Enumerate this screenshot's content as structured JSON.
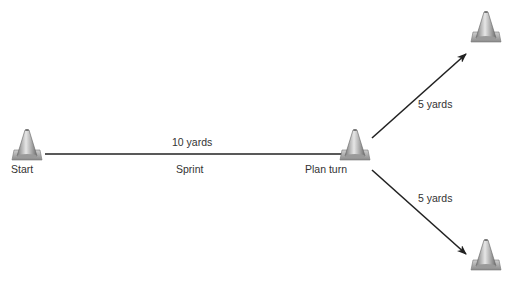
{
  "diagram": {
    "nodes": [
      {
        "id": "start",
        "label": "Start"
      },
      {
        "id": "plan_turn",
        "label": "Plan turn"
      },
      {
        "id": "top_cone",
        "label": ""
      },
      {
        "id": "bottom_cone",
        "label": ""
      }
    ],
    "edges": [
      {
        "from": "start",
        "to": "plan_turn",
        "distance": "10 yards",
        "action": "Sprint"
      },
      {
        "from": "plan_turn",
        "to": "top_cone",
        "distance": "5 yards"
      },
      {
        "from": "plan_turn",
        "to": "bottom_cone",
        "distance": "5 yards"
      }
    ],
    "colors": {
      "line": "#222222",
      "cone": "#a8a8a8",
      "text": "#333333"
    }
  }
}
